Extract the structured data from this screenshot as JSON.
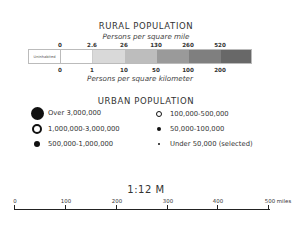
{
  "rural": {
    "title": "RURAL POPULATION",
    "subtitle_top": "Persons per square mile",
    "subtitle_bottom": "Persons per square kilometer",
    "uninhabited_label": "Uninhabited",
    "mile_ticks": [
      "0",
      "2.6",
      "26",
      "130",
      "260",
      "520"
    ],
    "km_ticks": [
      "0",
      "1",
      "10",
      "50",
      "100",
      "200"
    ],
    "colors": [
      "#ffffff",
      "#ffffff",
      "#d9d9d9",
      "#bdbdbd",
      "#9a9a9a",
      "#7f7f7f",
      "#686868"
    ]
  },
  "urban": {
    "title": "URBAN POPULATION",
    "items": [
      {
        "label": "Over 3,000,000",
        "symbol": "large-filled-dot"
      },
      {
        "label": "1,000,000-3,000,000",
        "symbol": "large-ring"
      },
      {
        "label": "500,000-1,000,000",
        "symbol": "medium-filled-dot"
      },
      {
        "label": "100,000-500,000",
        "symbol": "small-ring"
      },
      {
        "label": "50,000-100,000",
        "symbol": "small-filled-dot"
      },
      {
        "label": "Under 50,000 (selected)",
        "symbol": "tiny-filled-dot"
      }
    ]
  },
  "scale": {
    "ratio": "1:12 M",
    "ticks": [
      "0",
      "100",
      "200",
      "300",
      "400",
      "500 miles"
    ]
  }
}
